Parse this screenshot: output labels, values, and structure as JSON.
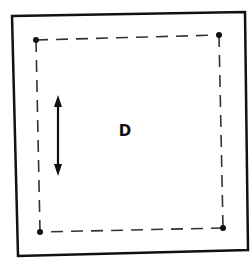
{
  "diagram": {
    "center_label": "D",
    "outer_frame": {
      "style": "solid",
      "color": "#111111"
    },
    "inner_frame": {
      "style": "dashed",
      "color": "#333333"
    },
    "corner_dots": [
      "top-left",
      "top-right",
      "bottom-right",
      "bottom-left"
    ],
    "arrow": {
      "type": "double-headed",
      "orientation": "vertical",
      "position": "left"
    }
  }
}
